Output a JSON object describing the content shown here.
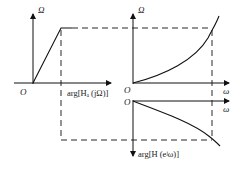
{
  "diagram": {
    "left_plot": {
      "y_axis_label": "Ω",
      "x_axis_label": "arg[Hₐ (jΩ)]",
      "origin_label": "O"
    },
    "middle_plot": {
      "y_axis_label": "Ω",
      "x_axis_label": "ω",
      "origin_label": "O",
      "curve": "tan warping Ω = (2/T) tan(ω/2)"
    },
    "bottom_plot": {
      "x_axis_label": "ω",
      "y_axis_label": "arg[H (e^jω)]",
      "origin_label": "O"
    }
  },
  "labels": {
    "omega_cap_left": "Ω",
    "origin_left": "O",
    "arg_ha": "arg[Hₐ (jΩ)]",
    "omega_cap_mid": "Ω",
    "origin_mid": "O",
    "omega_mid": "ω",
    "origin_bottom": "O",
    "omega_bottom": "ω",
    "arg_h": "arg[H (eʲω)]"
  },
  "colors": {
    "line": "#111111",
    "text": "#222222"
  }
}
